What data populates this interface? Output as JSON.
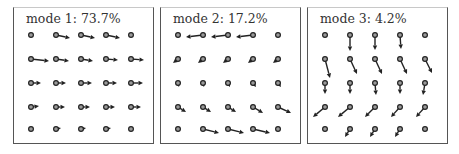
{
  "figure": {
    "colors": {
      "arrow": "#222222",
      "node_fill": "#9a9a9a",
      "node_stroke": "#222222",
      "border": "#555555"
    },
    "panels": [
      {
        "title": "mode 1: 73.7%",
        "mode": 1,
        "variance_percent": 73.7,
        "vectors": [
          [
            [
              0,
              0
            ],
            [
              14,
              3
            ],
            [
              14,
              3
            ],
            [
              14,
              3
            ],
            [
              0,
              0
            ]
          ],
          [
            [
              18,
              2
            ],
            [
              13,
              2
            ],
            [
              12,
              2
            ],
            [
              12,
              1
            ],
            [
              13,
              1
            ]
          ],
          [
            [
              10,
              0
            ],
            [
              10,
              0
            ],
            [
              11,
              0
            ],
            [
              11,
              0
            ],
            [
              12,
              0
            ]
          ],
          [
            [
              8,
              -1
            ],
            [
              9,
              0
            ],
            [
              9,
              0
            ],
            [
              9,
              0
            ],
            [
              10,
              0
            ]
          ],
          [
            [
              0,
              0
            ],
            [
              5,
              -1
            ],
            [
              5,
              -1
            ],
            [
              5,
              -1
            ],
            [
              0,
              0
            ]
          ]
        ]
      },
      {
        "title": "mode 2: 17.2%",
        "mode": 2,
        "variance_percent": 17.2,
        "vectors": [
          [
            [
              0,
              0
            ],
            [
              -17,
              2
            ],
            [
              -17,
              2
            ],
            [
              -17,
              2
            ],
            [
              0,
              0
            ]
          ],
          [
            [
              -5,
              4
            ],
            [
              -5,
              4
            ],
            [
              -5,
              4
            ],
            [
              -5,
              4
            ],
            [
              -5,
              4
            ]
          ],
          [
            [
              1,
              4
            ],
            [
              1,
              4
            ],
            [
              2,
              4
            ],
            [
              3,
              4
            ],
            [
              3,
              4
            ]
          ],
          [
            [
              8,
              5
            ],
            [
              8,
              5
            ],
            [
              8,
              5
            ],
            [
              10,
              6
            ],
            [
              13,
              6
            ]
          ],
          [
            [
              0,
              0
            ],
            [
              16,
              4
            ],
            [
              16,
              4
            ],
            [
              17,
              4
            ],
            [
              0,
              0
            ]
          ]
        ]
      },
      {
        "title": "mode 3: 4.2%",
        "mode": 3,
        "variance_percent": 4.2,
        "vectors": [
          [
            [
              0,
              0
            ],
            [
              0,
              16
            ],
            [
              0,
              15
            ],
            [
              1,
              14
            ],
            [
              0,
              0
            ]
          ],
          [
            [
              5,
              19
            ],
            [
              7,
              15
            ],
            [
              7,
              15
            ],
            [
              7,
              15
            ],
            [
              7,
              14
            ]
          ],
          [
            [
              0,
              11
            ],
            [
              0,
              11
            ],
            [
              1,
              12
            ],
            [
              0,
              11
            ],
            [
              -2,
              12
            ]
          ],
          [
            [
              -12,
              10
            ],
            [
              -12,
              10
            ],
            [
              -10,
              10
            ],
            [
              -9,
              10
            ],
            [
              -9,
              10
            ]
          ],
          [
            [
              0,
              0
            ],
            [
              -5,
              8
            ],
            [
              -5,
              8
            ],
            [
              -5,
              8
            ],
            [
              0,
              0
            ]
          ]
        ]
      }
    ]
  }
}
